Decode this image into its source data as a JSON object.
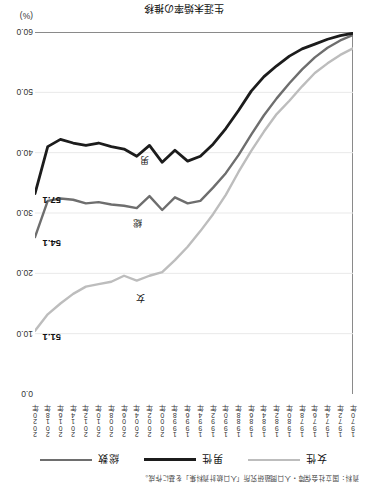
{
  "figure": {
    "title": "生涯未婚率の推移",
    "source_note": "資料：国立社会保障・人口問題研究所「人口統計資料集」を基に作成。",
    "unit_label": "(%)"
  },
  "legend": {
    "items": [
      {
        "label": "女性",
        "color": "#bdbdbd",
        "icon": "line-swatch-icon"
      },
      {
        "label": "男性",
        "color": "#1c1c1c",
        "icon": "line-swatch-icon"
      },
      {
        "label": "総数",
        "color": "#6e6e6e",
        "icon": "line-swatch-icon"
      }
    ]
  },
  "annotations": [
    {
      "label": "女",
      "x": 0.655,
      "y": 15.5
    },
    {
      "label": "総",
      "x": 0.665,
      "y": 28.0
    },
    {
      "label": "男",
      "x": 0.64,
      "y": 38.5
    }
  ],
  "end_labels": [
    {
      "label": "51.1",
      "series": "女性",
      "value": 51.1
    },
    {
      "label": "54.1",
      "series": "総数",
      "value": 54.1
    },
    {
      "label": "57.1",
      "series": "男性",
      "value": 57.1
    }
  ],
  "chart_data": {
    "type": "line",
    "title": "生涯未婚率の推移",
    "xlabel": "",
    "ylabel": "",
    "yunit": "(%)",
    "ylim": [
      0.0,
      60.0
    ],
    "y_inverted": true,
    "yticks": [
      "0.0",
      "10.0",
      "20.0",
      "30.0",
      "40.0",
      "50.0",
      "60.0"
    ],
    "ytick_values": [
      0.0,
      10.0,
      20.0,
      30.0,
      40.0,
      50.0,
      60.0
    ],
    "grid": true,
    "legend_position": "top",
    "x": [
      "1970年",
      "1972年",
      "1974年",
      "1976年",
      "1978年",
      "1980年",
      "1982年",
      "1984年",
      "1986年",
      "1988年",
      "1990年",
      "1992年",
      "1994年",
      "1996年",
      "1998年",
      "2000年",
      "2002年",
      "2004年",
      "2006年",
      "2008年",
      "2010年",
      "2012年",
      "2014年",
      "2016年",
      "2018年",
      "2020年"
    ],
    "categories": [
      "1970年",
      "1972年",
      "1974年",
      "1976年",
      "1978年",
      "1980年",
      "1982年",
      "1984年",
      "1986年",
      "1988年",
      "1990年",
      "1992年",
      "1994年",
      "1996年",
      "1998年",
      "2000年",
      "2002年",
      "2004年",
      "2006年",
      "2008年",
      "2010年",
      "2012年",
      "2014年",
      "2016年",
      "2018年",
      "2020年"
    ],
    "series": [
      {
        "name": "女性",
        "color": "#bdbdbd",
        "values": [
          57.3,
          56.2,
          54.8,
          53.2,
          51.0,
          48.6,
          46.4,
          43.5,
          40.3,
          36.8,
          33.0,
          29.8,
          27.0,
          24.4,
          22.2,
          20.2,
          19.6,
          18.8,
          19.6,
          18.6,
          18.2,
          17.8,
          16.6,
          15.0,
          13.2,
          10.5
        ]
      },
      {
        "name": "総数",
        "color": "#6e6e6e",
        "values": [
          59.5,
          58.6,
          57.4,
          55.8,
          53.8,
          51.5,
          49.0,
          46.2,
          43.0,
          39.6,
          36.6,
          34.2,
          32.0,
          31.6,
          32.6,
          30.5,
          32.8,
          30.8,
          31.2,
          31.4,
          31.8,
          31.6,
          32.2,
          32.4,
          32.0,
          26.0
        ]
      },
      {
        "name": "男性",
        "color": "#1c1c1c",
        "values": [
          59.8,
          59.4,
          58.8,
          58.0,
          57.2,
          56.0,
          54.4,
          52.6,
          50.2,
          47.0,
          44.0,
          41.4,
          39.4,
          38.6,
          40.4,
          38.4,
          41.2,
          39.4,
          40.6,
          41.0,
          41.6,
          41.2,
          41.6,
          42.2,
          41.0,
          33.2
        ]
      }
    ]
  }
}
